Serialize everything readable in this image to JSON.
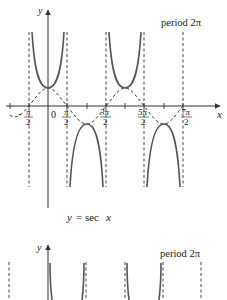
{
  "figure_1": {
    "title": "y = sec x",
    "caption_y": "y",
    "caption_eq": "= sec",
    "caption_x": "x",
    "period_label": "period 2π",
    "axis_x_label": "x",
    "axis_y_label": "y",
    "origin_label": "0",
    "tick_labels": [
      {
        "num": "π",
        "den": "2",
        "sign": "-"
      },
      {
        "num": "π",
        "den": "2",
        "sign": ""
      },
      {
        "num": "3π",
        "den": "2",
        "sign": ""
      },
      {
        "num": "5π",
        "den": "2",
        "sign": ""
      },
      {
        "num": "7π",
        "den": "2",
        "sign": ""
      }
    ],
    "asymptotes": [
      "-π/2",
      "π/2",
      "3π/2",
      "5π/2",
      "7π/2"
    ],
    "curve_solid": "sec x",
    "curve_dashed": "cos x"
  },
  "figure_2": {
    "axis_y_label": "y",
    "period_label": "period 2π",
    "curve_solid": "csc x (partial, cropped)"
  },
  "colors": {
    "curve": "#555555",
    "axis": "#333333",
    "dashed": "#333333",
    "text": "#222222"
  }
}
